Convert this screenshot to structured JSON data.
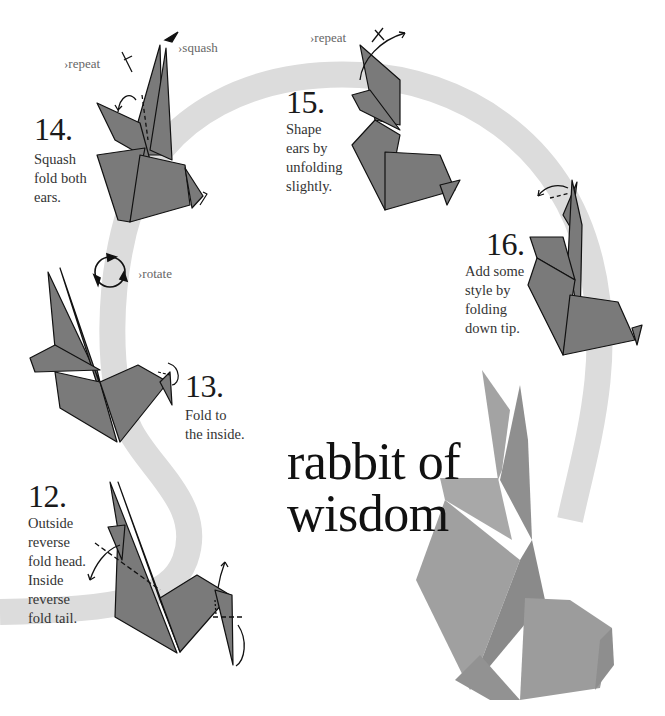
{
  "page": {
    "title_line1": "rabbit of",
    "title_line2": "wisdom"
  },
  "steps": [
    {
      "number": "12.",
      "lines": [
        "Outside",
        "reverse",
        "fold head.",
        "Inside",
        "reverse",
        "fold tail."
      ]
    },
    {
      "number": "13.",
      "lines": [
        "Fold to",
        "the inside."
      ]
    },
    {
      "number": "14.",
      "lines": [
        "Squash",
        "fold both",
        "ears."
      ]
    },
    {
      "number": "15.",
      "lines": [
        "Shape",
        "ears by",
        "unfolding",
        "slightly."
      ]
    },
    {
      "number": "16.",
      "lines": [
        "Add some",
        "style by",
        "folding",
        "down tip."
      ]
    }
  ],
  "annotations": {
    "rotate": "›rotate",
    "repeat_14": "›repeat",
    "squash_14": "›squash",
    "repeat_15": "›repeat"
  },
  "colors": {
    "band": "#dcdcdc",
    "diagram_fill": "#7a7a7a",
    "photo_fill": "#9a9a9a",
    "text": "#1a1a1a"
  }
}
